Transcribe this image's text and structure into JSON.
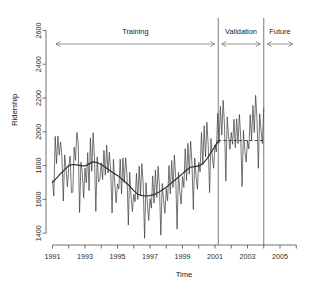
{
  "chart_data": {
    "type": "line",
    "title": "",
    "xlabel": "Time",
    "ylabel": "Ridership",
    "xlim": [
      1990.6,
      2006.6
    ],
    "ylim": [
      1330,
      2620
    ],
    "grid": false,
    "legend_position": "none",
    "x_ticks": [
      1991,
      1993,
      1995,
      1997,
      1999,
      2001,
      2003,
      2005
    ],
    "x_tick_labels": [
      "1991",
      "1993",
      "1995",
      "1997",
      "1999",
      "2001",
      "2003",
      "2005"
    ],
    "x_minor_ticks": [
      1992,
      1994,
      1996,
      1998,
      2000,
      2002,
      2004,
      2006
    ],
    "y_ticks": [
      1400,
      1600,
      1800,
      2000,
      2200,
      2400,
      2600
    ],
    "y_tick_labels": [
      "1400",
      "1600",
      "1800",
      "2000",
      "2200",
      "2400",
      "2600"
    ],
    "annotations": [
      {
        "name": "training",
        "label": "Training",
        "x_start": 1991.0,
        "x_end": 2001.2
      },
      {
        "name": "validation",
        "label": "Validation",
        "x_start": 2001.2,
        "x_end": 2004.0
      },
      {
        "name": "future",
        "label": "Future",
        "x_start": 2004.0,
        "x_end": 2006.0
      }
    ],
    "vertical_dividers": [
      2001.2,
      2004.0
    ],
    "series": [
      {
        "name": "Ridership (monthly)",
        "style": "thin-solid",
        "x": [
          1991.0,
          1991.083,
          1991.167,
          1991.25,
          1991.333,
          1991.417,
          1991.5,
          1991.583,
          1991.667,
          1991.75,
          1991.833,
          1991.917,
          1992.0,
          1992.083,
          1992.167,
          1992.25,
          1992.333,
          1992.417,
          1992.5,
          1992.583,
          1992.667,
          1992.75,
          1992.833,
          1992.917,
          1993.0,
          1993.083,
          1993.167,
          1993.25,
          1993.333,
          1993.417,
          1993.5,
          1993.583,
          1993.667,
          1993.75,
          1993.833,
          1993.917,
          1994.0,
          1994.083,
          1994.167,
          1994.25,
          1994.333,
          1994.417,
          1994.5,
          1994.583,
          1994.667,
          1994.75,
          1994.833,
          1994.917,
          1995.0,
          1995.083,
          1995.167,
          1995.25,
          1995.333,
          1995.417,
          1995.5,
          1995.583,
          1995.667,
          1995.75,
          1995.833,
          1995.917,
          1996.0,
          1996.083,
          1996.167,
          1996.25,
          1996.333,
          1996.417,
          1996.5,
          1996.583,
          1996.667,
          1996.75,
          1996.833,
          1996.917,
          1997.0,
          1997.083,
          1997.167,
          1997.25,
          1997.333,
          1997.417,
          1997.5,
          1997.583,
          1997.667,
          1997.75,
          1997.833,
          1997.917,
          1998.0,
          1998.083,
          1998.167,
          1998.25,
          1998.333,
          1998.417,
          1998.5,
          1998.583,
          1998.667,
          1998.75,
          1998.833,
          1998.917,
          1999.0,
          1999.083,
          1999.167,
          1999.25,
          1999.333,
          1999.417,
          1999.5,
          1999.583,
          1999.667,
          1999.75,
          1999.833,
          1999.917,
          2000.0,
          2000.083,
          2000.167,
          2000.25,
          2000.333,
          2000.417,
          2000.5,
          2000.583,
          2000.667,
          2000.75,
          2000.833,
          2000.917,
          2001.0,
          2001.083,
          2001.167,
          2001.25,
          2001.333,
          2001.417,
          2001.5,
          2001.583,
          2001.667,
          2001.75,
          2001.833,
          2001.917,
          2002.0,
          2002.083,
          2002.167,
          2002.25,
          2002.333,
          2002.417,
          2002.5,
          2002.583,
          2002.667,
          2002.75,
          2002.833,
          2002.917,
          2003.0,
          2003.083,
          2003.167,
          2003.25,
          2003.333,
          2003.417,
          2003.5,
          2003.583,
          2003.667,
          2003.75,
          2003.833,
          2003.917,
          2004.0
        ],
        "values": [
          1709,
          1621,
          1973,
          1812,
          1975,
          1862,
          1940,
          1846,
          1590,
          1863,
          1782,
          1674,
          1792,
          1856,
          1640,
          1643,
          1909,
          1831,
          1996,
          1934,
          1522,
          1820,
          1757,
          1609,
          1786,
          1698,
          1876,
          1652,
          1964,
          1766,
          1994,
          1847,
          1529,
          1851,
          1703,
          1720,
          1816,
          1717,
          1890,
          1743,
          1921,
          1756,
          1880,
          1764,
          1520,
          1837,
          1692,
          1580,
          1692,
          1662,
          1838,
          1631,
          1845,
          1700,
          1846,
          1747,
          1448,
          1761,
          1616,
          1527,
          1631,
          1586,
          1755,
          1599,
          1797,
          1627,
          1811,
          1690,
          1370,
          1698,
          1585,
          1475,
          1605,
          1548,
          1739,
          1578,
          1774,
          1611,
          1795,
          1670,
          1388,
          1694,
          1600,
          1518,
          1664,
          1592,
          1800,
          1632,
          1830,
          1670,
          1862,
          1728,
          1424,
          1760,
          1650,
          1572,
          1735,
          1671,
          1900,
          1712,
          1932,
          1749,
          1944,
          1810,
          1540,
          1845,
          1736,
          1660,
          1820,
          1762,
          1996,
          1806,
          2036,
          1851,
          2056,
          1920,
          1640,
          1960,
          1858,
          1784,
          1922,
          1880,
          2110,
          1932,
          2150,
          1980,
          2186,
          2040,
          1708,
          2088,
          1972,
          1896,
          1996,
          1926,
          2074,
          1906,
          2076,
          1930,
          2102,
          1968,
          1676,
          2008,
          1890,
          1820,
          1948,
          1898,
          2102,
          1950,
          2156,
          1996,
          2216,
          2078,
          1784,
          2106,
          2006,
          1930,
          2140
        ]
      },
      {
        "name": "Trend (smoothed)",
        "style": "thick-solid",
        "x": [
          1991.0,
          1991.25,
          1991.5,
          1991.75,
          1992.0,
          1992.25,
          1992.5,
          1992.75,
          1993.0,
          1993.25,
          1993.5,
          1993.75,
          1994.0,
          1994.25,
          1994.5,
          1994.75,
          1995.0,
          1995.25,
          1995.5,
          1995.75,
          1996.0,
          1996.25,
          1996.5,
          1996.75,
          1997.0,
          1997.25,
          1997.5,
          1997.75,
          1998.0,
          1998.25,
          1998.5,
          1998.75,
          1999.0,
          1999.25,
          1999.5,
          1999.75,
          2000.0,
          2000.25,
          2000.5,
          2000.75,
          2001.0,
          2001.2
        ],
        "values": [
          1700,
          1726,
          1752,
          1776,
          1800,
          1806,
          1804,
          1800,
          1798,
          1810,
          1822,
          1818,
          1806,
          1790,
          1772,
          1756,
          1742,
          1722,
          1700,
          1678,
          1652,
          1630,
          1622,
          1620,
          1622,
          1628,
          1640,
          1656,
          1672,
          1692,
          1712,
          1732,
          1752,
          1774,
          1790,
          1794,
          1798,
          1812,
          1840,
          1876,
          1915,
          1946
        ]
      },
      {
        "name": "Forecast (validation)",
        "style": "dashed",
        "x": [
          2001.2,
          2004.0
        ],
        "values": [
          1948,
          1948
        ]
      }
    ]
  }
}
